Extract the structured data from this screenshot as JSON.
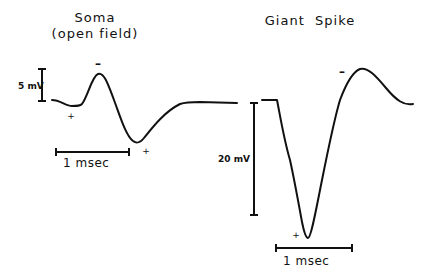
{
  "panels": [
    {
      "id": "soma",
      "title_line1": "Soma",
      "title_line2": "(open field)",
      "voltage_scale_label": "5 mV",
      "time_scale_label": "1 msec",
      "polarity_marks": {
        "peak": "–",
        "initial_dip": "+",
        "trough": "+"
      }
    },
    {
      "id": "giant-spike",
      "title_line1": "Giant  Spike",
      "voltage_scale_label": "20 mV",
      "time_scale_label": "1 msec",
      "polarity_marks": {
        "peak": "–",
        "trough": "+"
      }
    }
  ]
}
